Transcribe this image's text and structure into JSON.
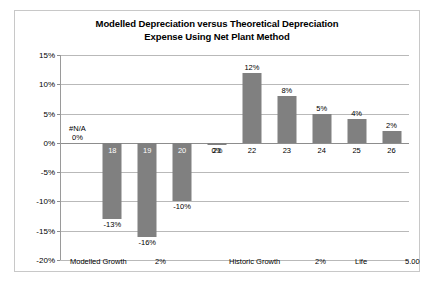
{
  "chart_data": {
    "type": "bar",
    "title": "Modelled Depreciation versus Theoretical Depreciation Expense Using Net Plant Method",
    "title_lines": [
      "Modelled Depreciation versus Theoretical Depreciation",
      "Expense Using Net Plant Method"
    ],
    "xlabel": "",
    "ylabel": "",
    "ylim": [
      -20,
      15
    ],
    "ytick_labels": [
      "15%",
      "10%",
      "5%",
      "0%",
      "-5%",
      "-10%",
      "-15%",
      "-20%"
    ],
    "ytick_values": [
      15,
      10,
      5,
      0,
      -5,
      -10,
      -15,
      -20
    ],
    "grid": true,
    "legend": "none",
    "bar_color": "#808080",
    "categories": [
      "",
      "18",
      "19",
      "20",
      "21",
      "22",
      "23",
      "24",
      "25",
      "26"
    ],
    "values": [
      0,
      -13,
      -16,
      -10,
      -0.4,
      12,
      8,
      5,
      4,
      2
    ],
    "value_labels": [
      "0%",
      "-13%",
      "-16%",
      "-10%",
      "0%",
      "12%",
      "8%",
      "5%",
      "4%",
      "2%"
    ],
    "first_point_note": "#N/A",
    "annotations": [
      {
        "label": "Modelled Growth",
        "value": "2%"
      },
      {
        "label": "Historic Growth",
        "value": "2%"
      },
      {
        "label": "Life",
        "value": "5.00"
      }
    ]
  }
}
